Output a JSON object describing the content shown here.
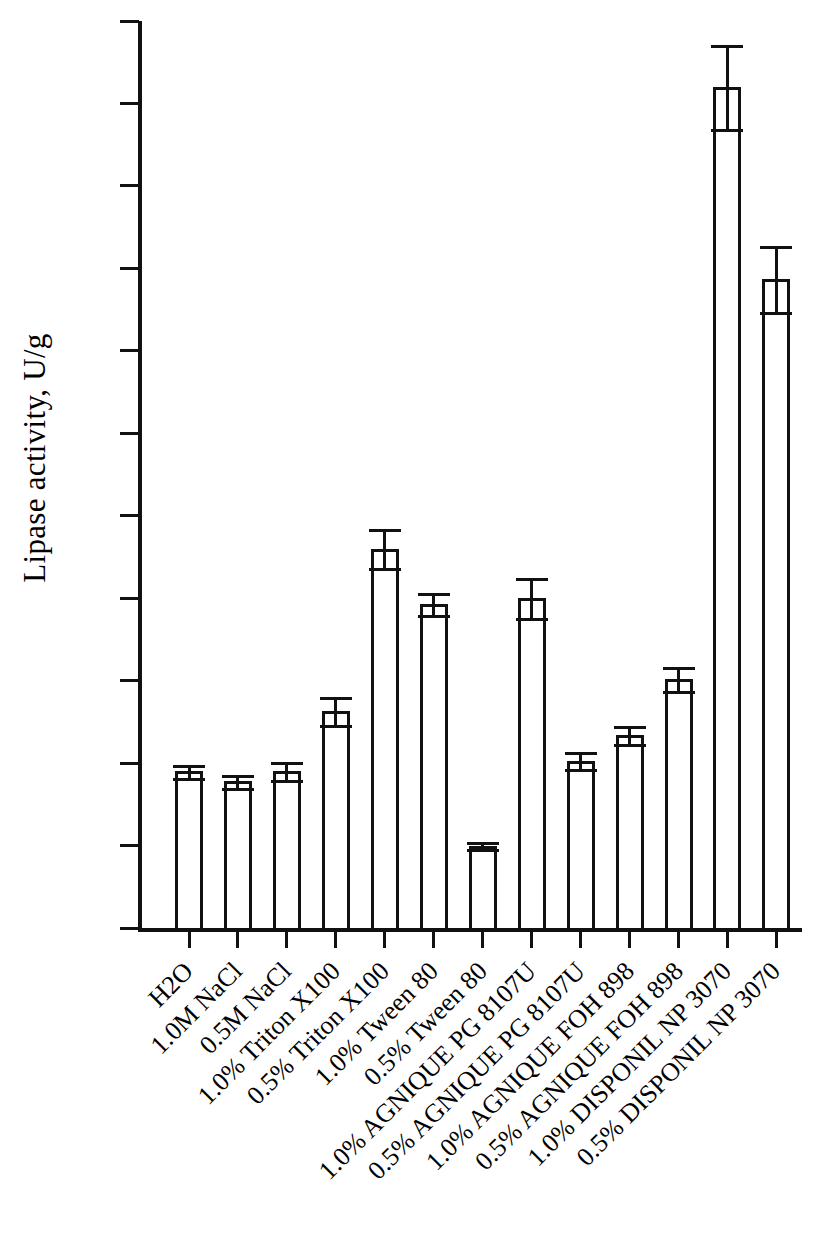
{
  "chart_data": {
    "type": "bar",
    "title": "",
    "xlabel": "",
    "ylabel": "Lipase activity, U/g",
    "ylim": [
      0,
      1100
    ],
    "ytick_step": 100,
    "yticks": [
      0,
      100,
      200,
      300,
      400,
      500,
      600,
      700,
      800,
      900,
      1000,
      1100
    ],
    "ytick_labels": [
      "0",
      "100",
      "200",
      "300",
      "400",
      "500",
      "600",
      "700",
      "800",
      "900",
      "1000",
      "1100"
    ],
    "grid": false,
    "legend": null,
    "bar_fill": "#ffffff",
    "bar_edge": "#111111",
    "error_bars": "upper-only caps",
    "categories": [
      "H2O",
      "1.0M NaCl",
      "0.5M NaCl",
      "1.0% Triton X100",
      "0.5% Triton X100",
      "1.0% Tween 80",
      "0.5% Tween 80",
      "1.0% AGNIQUE PG 8107U",
      "0.5% AGNIQUE PG 8107U",
      "1.0% AGNIQUE FOH 898",
      "0.5% AGNIQUE FOH 898",
      "1.0% DISPONIL NP 3070",
      "0.5% DISPONIL NP 3070"
    ],
    "values": [
      190,
      178,
      190,
      263,
      460,
      393,
      100,
      400,
      203,
      234,
      302,
      1020,
      787
    ],
    "errors": [
      8,
      8,
      11,
      17,
      24,
      13,
      4,
      24,
      10,
      11,
      14,
      51,
      40
    ]
  }
}
